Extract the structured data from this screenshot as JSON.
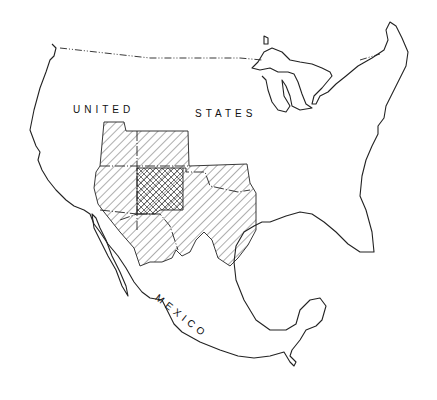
{
  "map": {
    "title": "",
    "labels": {
      "us": {
        "word1": "UNITED",
        "word2": "STATES"
      },
      "mexico": "MEXICO"
    },
    "legend": [],
    "regions": [
      {
        "name": "single-hatched region",
        "pattern": "diagonal-hatch",
        "states": [
          "Utah",
          "Colorado",
          "Arizona",
          "Oklahoma panhandle/Texas",
          "Sonora",
          "Chihuahua"
        ]
      },
      {
        "name": "cross-hatched core",
        "pattern": "cross-hatch",
        "states": [
          "New Mexico"
        ]
      }
    ],
    "colors": {
      "ink": "#222222",
      "background": "#ffffff"
    }
  }
}
